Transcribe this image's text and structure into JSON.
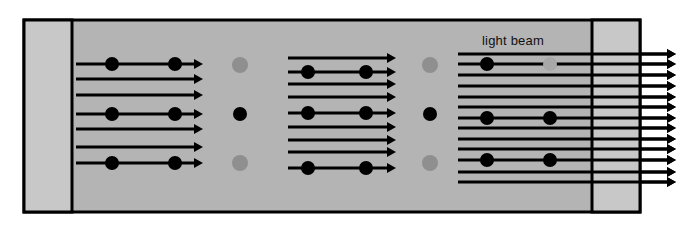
{
  "figure": {
    "label": "light beam",
    "label_x": 513,
    "label_y": 45,
    "canvas": {
      "width": 690,
      "height": 229
    }
  },
  "colors": {
    "background": "#ffffff",
    "medium_fill": "#b4b4b4",
    "end_block_fill": "#c8c8c8",
    "stroke": "#000000",
    "particle": "#000000",
    "particle_faded": "#8f8f8f",
    "particle_faded_light": "#a8a8a8"
  },
  "frame": {
    "x": 24,
    "y": 20,
    "width": 616,
    "height": 192,
    "stroke_width": 3,
    "left_block": {
      "x": 24,
      "y": 20,
      "width": 48,
      "height": 192
    },
    "right_block": {
      "x": 592,
      "y": 20,
      "width": 48,
      "height": 192
    },
    "left_divider_x": 72,
    "right_divider_x": 592
  },
  "geometry": {
    "line_stroke_width": 3,
    "arrow_head_length": 9,
    "arrow_head_half_width": 5,
    "particle_radius": 7,
    "faded_particle_radius": 8
  },
  "beam_groups": [
    {
      "name": "group-1",
      "x_start": 76,
      "x_end": 203,
      "particle_x": [
        112,
        175
      ],
      "rows": [
        {
          "y": 64,
          "particles": true
        },
        {
          "y": 79,
          "particles": false
        },
        {
          "y": 95,
          "particles": false
        },
        {
          "y": 114,
          "particles": true
        },
        {
          "y": 129,
          "particles": false
        },
        {
          "y": 147,
          "particles": false
        },
        {
          "y": 163,
          "particles": true
        }
      ]
    },
    {
      "name": "group-2",
      "x_start": 288,
      "x_end": 396,
      "particle_x": [
        308,
        366
      ],
      "rows": [
        {
          "y": 58,
          "particles": false
        },
        {
          "y": 72,
          "particles": true
        },
        {
          "y": 84,
          "particles": false
        },
        {
          "y": 97,
          "particles": false
        },
        {
          "y": 113,
          "particles": true
        },
        {
          "y": 127,
          "particles": false
        },
        {
          "y": 140,
          "particles": false
        },
        {
          "y": 152,
          "particles": false
        },
        {
          "y": 168,
          "particles": true
        }
      ]
    },
    {
      "name": "group-3",
      "x_start": 458,
      "x_end": 676,
      "particle_x": [
        487,
        550
      ],
      "rows": [
        {
          "y": 54,
          "particles": false
        },
        {
          "y": 64,
          "particles": true,
          "second_faded": true
        },
        {
          "y": 75,
          "particles": false
        },
        {
          "y": 86,
          "particles": false
        },
        {
          "y": 97,
          "particles": false
        },
        {
          "y": 107,
          "particles": false
        },
        {
          "y": 118,
          "particles": true
        },
        {
          "y": 128,
          "particles": false
        },
        {
          "y": 139,
          "particles": false
        },
        {
          "y": 149,
          "particles": false
        },
        {
          "y": 160,
          "particles": true
        },
        {
          "y": 172,
          "particles": false
        },
        {
          "y": 182,
          "particles": false
        }
      ]
    }
  ],
  "gap_particles": [
    {
      "name": "gap-1-top",
      "x": 240,
      "y": 65,
      "shade": "faded"
    },
    {
      "name": "gap-1-middle",
      "x": 240,
      "y": 114,
      "shade": "solid"
    },
    {
      "name": "gap-1-bottom",
      "x": 240,
      "y": 163,
      "shade": "faded"
    },
    {
      "name": "gap-2-top",
      "x": 430,
      "y": 65,
      "shade": "faded"
    },
    {
      "name": "gap-2-middle",
      "x": 430,
      "y": 114,
      "shade": "solid"
    },
    {
      "name": "gap-2-bottom",
      "x": 430,
      "y": 163,
      "shade": "faded"
    }
  ],
  "exit_arrows": {
    "name": "exit-beams",
    "x_start": 640,
    "x_end": 676,
    "count": 13
  }
}
